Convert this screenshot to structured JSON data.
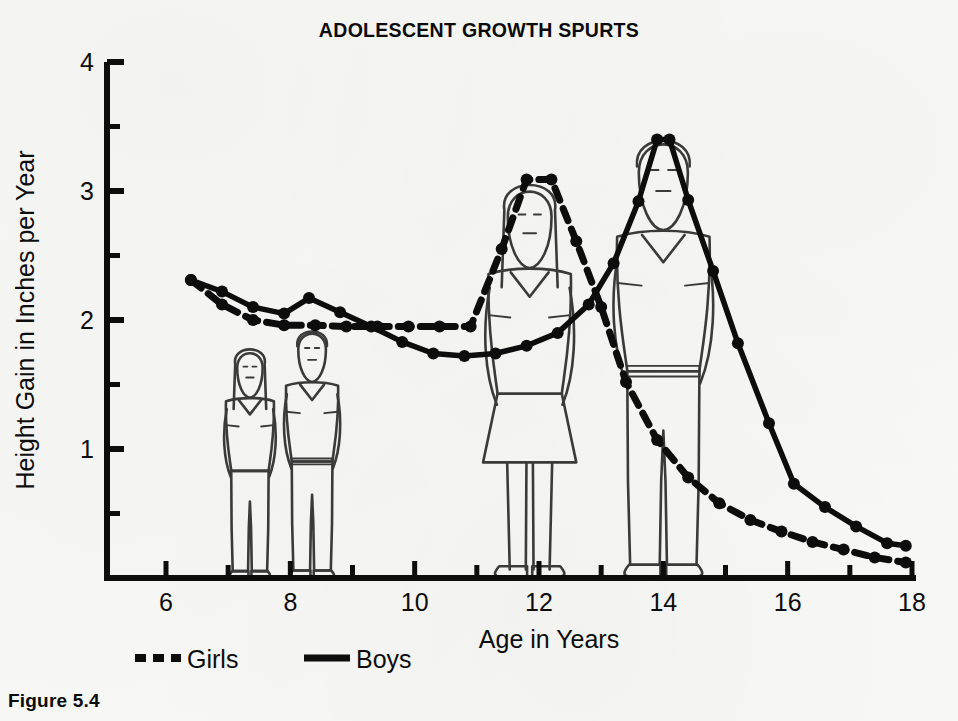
{
  "figure": {
    "caption": "Figure 5.4"
  },
  "chart_data": {
    "type": "line",
    "title": "ADOLESCENT GROWTH SPURTS",
    "xlabel": "Age in Years",
    "ylabel": "Height Gain in Inches per Year",
    "xlim": [
      5.6,
      18.2
    ],
    "ylim": [
      0,
      4
    ],
    "grid": false,
    "legend_position": "below-axis-left",
    "x_ticks_major": [
      6,
      8,
      10,
      12,
      14,
      16,
      18
    ],
    "x_ticks_minor": [
      7,
      9,
      11,
      13,
      15,
      17
    ],
    "x_tick_labels": [
      "6",
      "8",
      "10",
      "12",
      "14",
      "16",
      "18"
    ],
    "y_ticks_major": [
      1,
      2,
      3,
      4
    ],
    "y_ticks_minor": [
      0.5,
      1.5,
      2.5,
      3.5
    ],
    "y_tick_labels": [
      "1",
      "2",
      "3",
      "4"
    ],
    "series": [
      {
        "name": "Girls",
        "style": "dashed",
        "marker": "circle",
        "points": [
          [
            6.4,
            2.31
          ],
          [
            6.9,
            2.12
          ],
          [
            7.4,
            2.0
          ],
          [
            7.9,
            1.96
          ],
          [
            8.4,
            1.96
          ],
          [
            8.9,
            1.95
          ],
          [
            9.4,
            1.95
          ],
          [
            9.9,
            1.95
          ],
          [
            10.4,
            1.95
          ],
          [
            10.9,
            1.95
          ],
          [
            11.4,
            2.55
          ],
          [
            11.8,
            3.09
          ],
          [
            12.2,
            3.09
          ],
          [
            12.6,
            2.61
          ],
          [
            13.0,
            2.1
          ],
          [
            13.4,
            1.52
          ],
          [
            13.9,
            1.07
          ],
          [
            14.4,
            0.78
          ],
          [
            14.9,
            0.58
          ],
          [
            15.4,
            0.45
          ],
          [
            15.9,
            0.36
          ],
          [
            16.4,
            0.28
          ],
          [
            16.9,
            0.22
          ],
          [
            17.4,
            0.16
          ],
          [
            17.9,
            0.12
          ]
        ]
      },
      {
        "name": "Boys",
        "style": "solid",
        "marker": "circle",
        "points": [
          [
            6.4,
            2.31
          ],
          [
            6.9,
            2.22
          ],
          [
            7.4,
            2.1
          ],
          [
            7.9,
            2.05
          ],
          [
            8.3,
            2.17
          ],
          [
            8.8,
            2.06
          ],
          [
            9.3,
            1.95
          ],
          [
            9.8,
            1.83
          ],
          [
            10.3,
            1.74
          ],
          [
            10.8,
            1.72
          ],
          [
            11.3,
            1.74
          ],
          [
            11.8,
            1.8
          ],
          [
            12.3,
            1.9
          ],
          [
            12.8,
            2.12
          ],
          [
            13.2,
            2.44
          ],
          [
            13.6,
            2.92
          ],
          [
            13.9,
            3.4
          ],
          [
            14.1,
            3.4
          ],
          [
            14.4,
            2.93
          ],
          [
            14.8,
            2.38
          ],
          [
            15.2,
            1.82
          ],
          [
            15.7,
            1.2
          ],
          [
            16.1,
            0.73
          ],
          [
            16.6,
            0.55
          ],
          [
            17.1,
            0.4
          ],
          [
            17.6,
            0.27
          ],
          [
            17.9,
            0.25
          ]
        ]
      }
    ],
    "legend": [
      {
        "label": "Girls",
        "style": "dashed"
      },
      {
        "label": "Boys",
        "style": "solid"
      }
    ],
    "illustrations": [
      {
        "name": "young-girl",
        "age": 7.35,
        "label": "young girl figure"
      },
      {
        "name": "young-boy",
        "age": 8.35,
        "label": "young boy figure"
      },
      {
        "name": "teen-girl",
        "age": 11.85,
        "label": "adolescent girl figure"
      },
      {
        "name": "teen-boy",
        "age": 14.0,
        "label": "adolescent boy figure"
      }
    ]
  }
}
